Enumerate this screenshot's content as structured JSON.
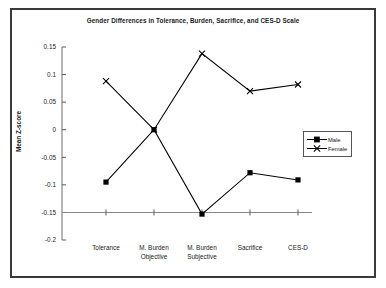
{
  "chart_data": {
    "type": "line",
    "title": "Gender Differences in Tolerance, Burden, Sacrifice, and CES-D Scale",
    "xlabel": "",
    "ylabel": "Mean Z-score",
    "categories": [
      "Tolerance",
      "M. Burden Objective",
      "M. Burden Subjective",
      "Sacrifice",
      "CES-D"
    ],
    "category_lines": [
      [
        "Tolerance"
      ],
      [
        "M. Burden",
        "Objective"
      ],
      [
        "M. Burden",
        "Subjective"
      ],
      [
        "Sacrifice"
      ],
      [
        "CES-D"
      ]
    ],
    "series": [
      {
        "name": "Male",
        "marker": "square",
        "color": "#000000",
        "values": [
          -0.095,
          0.0,
          -0.153,
          -0.078,
          -0.091
        ]
      },
      {
        "name": "Female",
        "marker": "x",
        "color": "#000000",
        "values": [
          0.088,
          0.0,
          0.138,
          0.07,
          0.082
        ]
      }
    ],
    "ylim": [
      -0.2,
      0.15
    ],
    "yticks": [
      0.15,
      0.1,
      0.05,
      0,
      -0.05,
      -0.1,
      -0.15,
      -0.2
    ],
    "ytick_labels": [
      "0.15",
      "0.1",
      "0.05",
      "0",
      "-0.05",
      "-0.1",
      "-0.15",
      "-0.2"
    ],
    "grid": false,
    "legend_position": "right",
    "axis_line_value": -0.15
  },
  "legend": {
    "entries": [
      {
        "label": "Male"
      },
      {
        "label": "Female"
      }
    ]
  },
  "frame": {
    "border_color": "#3a3a3a"
  }
}
